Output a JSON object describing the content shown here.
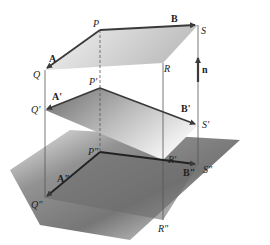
{
  "diagram": {
    "top_plane": {
      "points": {
        "P": "P",
        "Q": "Q",
        "R": "R",
        "S": "S"
      },
      "vectors": {
        "A": "A",
        "B": "B"
      }
    },
    "middle_plane": {
      "points": {
        "P": "P'",
        "Q": "Q'",
        "S": "S'"
      },
      "vectors": {
        "A": "A'",
        "B": "B'"
      }
    },
    "bottom_plane": {
      "points": {
        "P": "P\"",
        "Q": "Q\"",
        "R": "R\"",
        "S": "S\"",
        "R_prime": "R'"
      },
      "vectors": {
        "A": "A\"",
        "B": "B\""
      }
    },
    "normal_vector": "n",
    "colors": {
      "edge": "#3a3a3a",
      "top_fill": "#d0d0d0",
      "middle_fill": "#8a8a8a",
      "bottom_fill": "#6a6a6a"
    }
  }
}
